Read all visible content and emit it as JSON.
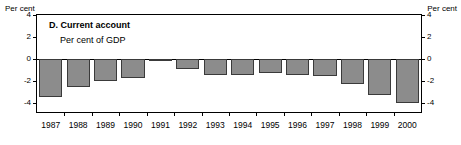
{
  "chart_data": {
    "type": "bar",
    "title": "D. Current account",
    "subtitle": "Per cent of GDP",
    "xlabel": "",
    "ylabel": "Per cent",
    "ylabel_right": "Per cent",
    "categories": [
      "1987",
      "1988",
      "1989",
      "1990",
      "1991",
      "1992",
      "1993",
      "1994",
      "1995",
      "1996",
      "1997",
      "1998",
      "1999",
      "2000"
    ],
    "values": [
      -3.4,
      -2.5,
      -2.0,
      -1.7,
      -0.1,
      -0.9,
      -1.4,
      -1.4,
      -1.3,
      -1.4,
      -1.5,
      -2.3,
      -3.3,
      -4.0
    ],
    "ylim": [
      -4.8,
      4
    ],
    "yticks": [
      4,
      2,
      0,
      -2,
      -4
    ],
    "ytick_labels": [
      "4",
      "2",
      "0",
      "-2",
      "-4"
    ],
    "grid": false,
    "legend": "none",
    "bar_color": "#8c8c8c",
    "bar_edge_color": "#3a3a3a",
    "axis_color": "#000000"
  }
}
